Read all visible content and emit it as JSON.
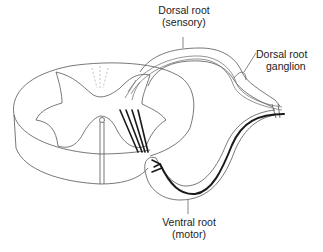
{
  "diagram": {
    "labels": {
      "dorsal_root": {
        "line1": "Dorsal root",
        "line2": "(sensory)"
      },
      "dorsal_root_ganglion": {
        "line1": "Dorsal root",
        "line2": "ganglion"
      },
      "ventral_root": {
        "line1": "Ventral root",
        "line2": "(motor)"
      }
    },
    "colors": {
      "outline": "#555555",
      "motor_fiber": "#1a1a1a",
      "sensory_fiber": "#666666",
      "background": "#ffffff"
    }
  }
}
